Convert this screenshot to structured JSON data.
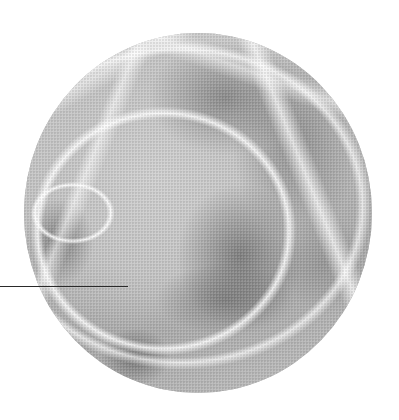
{
  "figure": {
    "shape": "circle",
    "tone": "grayscale",
    "colors": {
      "background": "#ffffff",
      "photo_base": "#bdbdbd",
      "highlight": "#ffffff",
      "shadow": "#6e6e6e",
      "leader_line": "#2a2a2a"
    }
  },
  "leader_line": {
    "orientation": "horizontal",
    "x_start": 0,
    "x_end": 128,
    "y": 286
  }
}
